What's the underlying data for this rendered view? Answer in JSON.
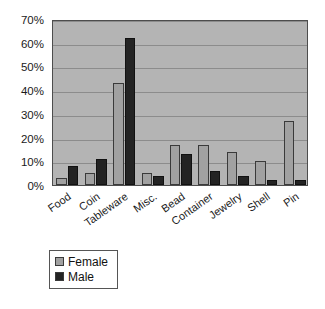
{
  "chart_data": {
    "type": "bar",
    "title": "",
    "subtitle": "",
    "xlabel": "",
    "ylabel": "",
    "categories": [
      "Food",
      "Coin",
      "Tableware",
      "Misc.",
      "Bead",
      "Container",
      "Jewelry",
      "Shell",
      "Pin"
    ],
    "series": [
      {
        "name": "Female",
        "color": "#a1a1a1",
        "values": [
          3,
          5,
          43,
          5,
          17,
          17,
          14,
          10,
          27
        ]
      },
      {
        "name": "Male",
        "color": "#232323",
        "values": [
          8,
          11,
          62,
          4,
          13,
          6,
          4,
          2,
          2
        ]
      }
    ],
    "ylim": [
      0,
      70
    ],
    "ytick_values": [
      0,
      10,
      20,
      30,
      40,
      50,
      60,
      70
    ],
    "ytick_labels": [
      "0%",
      "10%",
      "20%",
      "30%",
      "40%",
      "50%",
      "60%",
      "70%"
    ],
    "grid": true,
    "legend_position": "bottom-left",
    "plot_background": "#b4b4b4",
    "value_suffix": "%"
  }
}
